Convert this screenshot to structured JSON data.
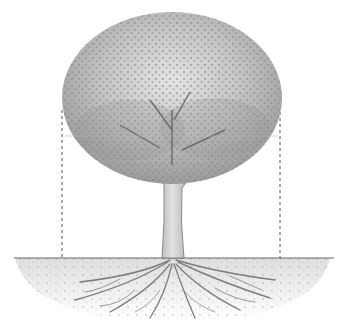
{
  "image": {
    "subject": "Pencil drawing of a tree showing canopy, trunk and spreading root system below ground",
    "style": "graphite sketch",
    "colors": {
      "background": "#ffffff",
      "canopy_light": "#d4d4d4",
      "canopy_mid": "#a8a8a8",
      "canopy_dark": "#7a7a7a",
      "trunk": "#bdbdbd",
      "trunk_outline": "#6e6e6e",
      "roots": "#8a8a8a",
      "soil": "#c8c8c8",
      "dashed_line": "#555555"
    },
    "elements": {
      "canopy": {
        "cx": 172,
        "cy": 92,
        "rx": 110,
        "ry": 85
      },
      "trunk": {
        "top_y": 160,
        "bottom_y": 258,
        "left_x": 163,
        "right_x": 180
      },
      "ground_line_y": 258,
      "drip_line_left_x": 62,
      "drip_line_right_x": 280,
      "drip_line_top_y": 110,
      "canopy_horizontal_line_y": 136
    }
  }
}
